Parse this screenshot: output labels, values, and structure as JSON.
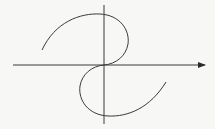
{
  "figure": {
    "description": "Curve symmetric about the origin drawn on coordinate axes",
    "background": "#f7f7f5",
    "stroke_color": "#3a3a3a",
    "x_axis": {
      "y": 65,
      "x_start": 13,
      "x_end": 205,
      "arrow": true
    },
    "y_axis": {
      "x": 104,
      "y_start": 5,
      "y_end": 124,
      "arrow": false
    },
    "curve_upper": "M42,50 C55,22 80,13 100,14 C120,15 130,30 128,44 C126,56 116,64 104,65",
    "curve_lower": "M104,65 C92,66 82,74 80,86 C78,100 88,115 108,116 C128,117 150,108 166,82"
  }
}
